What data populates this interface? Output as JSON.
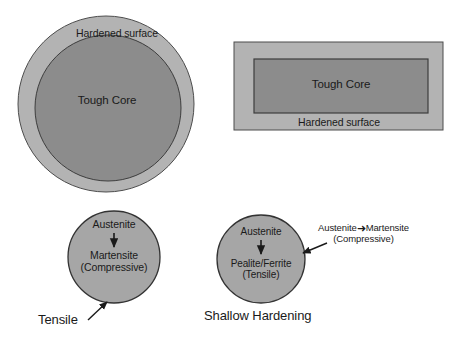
{
  "figure": {
    "background_color": "#ffffff",
    "colors": {
      "hardened_surface_fill": "#b3b3b3",
      "tough_core_fill": "#8c8c8c",
      "small_circle_fill": "#a6a6a6",
      "outline": "#333333",
      "text": "#1a1a1a"
    }
  },
  "round_section": {
    "outer_label": "Hardened surface",
    "inner_label": "Tough Core"
  },
  "rect_section": {
    "inner_label": "Tough Core",
    "outer_label": "Hardened surface"
  },
  "deep_hardening": {
    "phase_from": "Austenite",
    "phase_to": "Martensite",
    "stress_state": "(Compressive)",
    "surface_callout": "Tensile",
    "caption": "Tensile"
  },
  "shallow_hardening": {
    "phase_from": "Austenite",
    "phase_to": "Pealite/Ferrite",
    "stress_state": "(Tensile)",
    "caption": "Shallow Hardening",
    "annotation_line1_from": "Austenite",
    "annotation_line1_arrow": "➜",
    "annotation_line1_to": "Martensite",
    "annotation_line2": "(Compressive)"
  }
}
